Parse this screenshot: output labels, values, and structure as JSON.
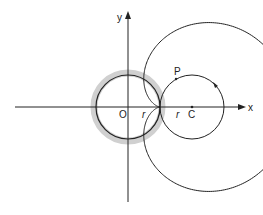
{
  "diagram": {
    "type": "cardioid-construction",
    "axes": {
      "x_label": "x",
      "y_label": "y",
      "origin_label": "O"
    },
    "fixed_circle": {
      "radius_label": "r",
      "highlight_color": "#cfcfcf"
    },
    "rolling_circle": {
      "center_label": "C",
      "radius_label": "r"
    },
    "point_label": "P",
    "colors": {
      "stroke": "#222222",
      "halo": "#cfcfcf",
      "background": "#ffffff"
    }
  }
}
